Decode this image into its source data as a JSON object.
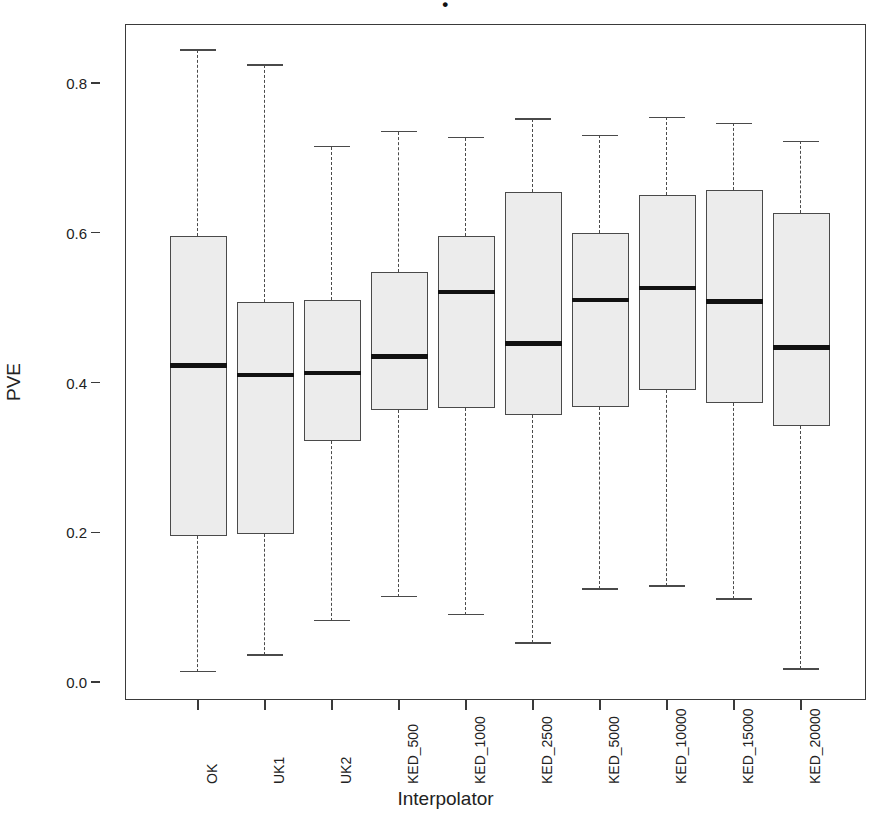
{
  "title_fragment": "•",
  "axes": {
    "y_label": "PVE",
    "x_label": "Interpolator",
    "y_ticks": [
      "0.0",
      "0.2",
      "0.4",
      "0.6",
      "0.8"
    ],
    "y_tick_values": [
      0.0,
      0.2,
      0.4,
      0.6,
      0.8
    ]
  },
  "chart_data": {
    "type": "boxplot",
    "title": "",
    "xlabel": "Interpolator",
    "ylabel": "PVE",
    "ylim": [
      0.0,
      0.88
    ],
    "grid": false,
    "legend": "none",
    "categories": [
      "OK",
      "UK1",
      "UK2",
      "KED_500",
      "KED_1000",
      "KED_2500",
      "KED_5000",
      "KED_10000",
      "KED_15000",
      "KED_20000"
    ],
    "boxes": [
      {
        "category": "OK",
        "whisker_low": 0.014,
        "q1": 0.195,
        "median": 0.423,
        "q3": 0.596,
        "whisker_high": 0.844
      },
      {
        "category": "UK1",
        "whisker_low": 0.036,
        "q1": 0.197,
        "median": 0.41,
        "q3": 0.508,
        "whisker_high": 0.824
      },
      {
        "category": "UK2",
        "whisker_low": 0.082,
        "q1": 0.322,
        "median": 0.413,
        "q3": 0.51,
        "whisker_high": 0.715
      },
      {
        "category": "KED_500",
        "whisker_low": 0.114,
        "q1": 0.363,
        "median": 0.435,
        "q3": 0.548,
        "whisker_high": 0.735
      },
      {
        "category": "KED_1000",
        "whisker_low": 0.09,
        "q1": 0.366,
        "median": 0.521,
        "q3": 0.596,
        "whisker_high": 0.727
      },
      {
        "category": "KED_2500",
        "whisker_low": 0.052,
        "q1": 0.357,
        "median": 0.452,
        "q3": 0.654,
        "whisker_high": 0.752
      },
      {
        "category": "KED_5000",
        "whisker_low": 0.124,
        "q1": 0.367,
        "median": 0.51,
        "q3": 0.6,
        "whisker_high": 0.73
      },
      {
        "category": "KED_10000",
        "whisker_low": 0.128,
        "q1": 0.39,
        "median": 0.526,
        "q3": 0.651,
        "whisker_high": 0.754
      },
      {
        "category": "KED_15000",
        "whisker_low": 0.111,
        "q1": 0.373,
        "median": 0.508,
        "q3": 0.657,
        "whisker_high": 0.746
      },
      {
        "category": "KED_20000",
        "whisker_low": 0.017,
        "q1": 0.342,
        "median": 0.447,
        "q3": 0.627,
        "whisker_high": 0.722
      }
    ]
  }
}
